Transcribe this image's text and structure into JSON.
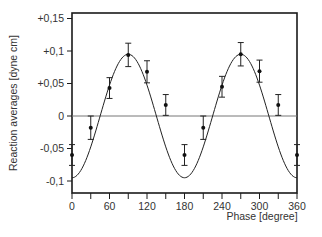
{
  "chart_data": {
    "type": "scatter",
    "title": "",
    "xlabel": "Phase [degree]",
    "ylabel": "Reaction averages [dyne cm]",
    "xlim": [
      0,
      360
    ],
    "ylim": [
      -0.125,
      0.16
    ],
    "x_ticks": [
      0,
      30,
      60,
      90,
      120,
      150,
      180,
      210,
      240,
      270,
      300,
      330,
      360
    ],
    "x_tick_labels": [
      "0",
      "60",
      "120",
      "180",
      "240",
      "300",
      "360"
    ],
    "x_tick_label_values": [
      0,
      60,
      120,
      180,
      240,
      300,
      360
    ],
    "y_ticks": [
      0.15,
      0.1,
      0.05,
      0,
      -0.05,
      -0.1
    ],
    "y_tick_labels": [
      "+0,15",
      "+0,1",
      "+0,05",
      "0",
      "-0,05",
      "-0,1"
    ],
    "grid": false,
    "zero_line": true,
    "series": [
      {
        "name": "measured",
        "style": "points-with-errorbars",
        "x": [
          0,
          30,
          60,
          90,
          120,
          150,
          180,
          210,
          240,
          270,
          300,
          330,
          360
        ],
        "y": [
          -0.06,
          -0.018,
          0.043,
          0.094,
          0.068,
          0.017,
          -0.06,
          -0.018,
          0.045,
          0.095,
          0.069,
          0.017,
          -0.06
        ],
        "err": [
          0.016,
          0.018,
          0.016,
          0.018,
          0.017,
          0.016,
          0.016,
          0.018,
          0.016,
          0.018,
          0.017,
          0.016,
          0.016
        ]
      },
      {
        "name": "fit",
        "style": "line",
        "function": "A*sin(2*(x-45deg))",
        "amplitude": 0.095,
        "period_deg": 180,
        "zero_crossings": [
          45,
          135,
          225,
          315
        ]
      }
    ]
  }
}
